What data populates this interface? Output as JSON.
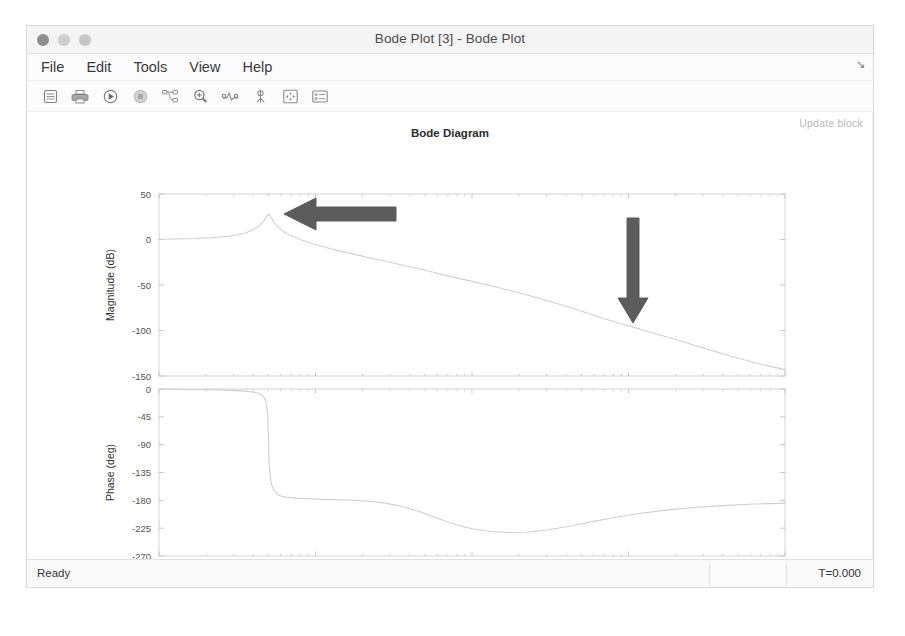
{
  "window": {
    "title": "Bode Plot [3] - Bode Plot",
    "traffic_lights": [
      "close",
      "minimize",
      "zoom"
    ]
  },
  "menubar": {
    "items": [
      {
        "label": "File",
        "name": "menu-file"
      },
      {
        "label": "Edit",
        "name": "menu-edit"
      },
      {
        "label": "Tools",
        "name": "menu-tools"
      },
      {
        "label": "View",
        "name": "menu-view"
      },
      {
        "label": "Help",
        "name": "menu-help"
      }
    ],
    "corner_glyph": "↘"
  },
  "toolbar": {
    "buttons": [
      {
        "icon": "save-icon",
        "title": "Save"
      },
      {
        "icon": "print-icon",
        "title": "Print"
      },
      {
        "icon": "run-icon",
        "title": "Run"
      },
      {
        "icon": "stop-icon",
        "title": "Stop"
      },
      {
        "icon": "linearization-icon",
        "title": "Linearization"
      },
      {
        "icon": "zoom-in-icon",
        "title": "Zoom In"
      },
      {
        "icon": "peak-response-icon",
        "title": "Peak Response"
      },
      {
        "icon": "data-cursor-icon",
        "title": "Data Cursor"
      },
      {
        "icon": "fit-to-view-icon",
        "title": "Fit to View"
      },
      {
        "icon": "properties-icon",
        "title": "Properties"
      }
    ]
  },
  "figure": {
    "update_block_label": "Update block"
  },
  "statusbar": {
    "status": "Ready",
    "time": "T=0.000"
  },
  "annotations": [
    {
      "name": "left-arrow-annotation",
      "direction": "left",
      "color": "#5c5c5c"
    },
    {
      "name": "down-arrow-annotation",
      "direction": "down",
      "color": "#5c5c5c"
    }
  ],
  "chart_data": {
    "type": "line",
    "title": "Bode Diagram",
    "xlabel": "Frequency  (rad/s)",
    "xscale": "log",
    "xlim": [
      1,
      10000
    ],
    "xticks": [
      1,
      10,
      100,
      1000,
      10000
    ],
    "xticklabels": [
      "10^0",
      "10^1",
      "10^2",
      "10^3",
      "10^4"
    ],
    "grid": false,
    "legend": null,
    "line_color": "#cfcfcf",
    "subplots": [
      {
        "name": "magnitude",
        "ylabel": "Magnitude (dB)",
        "ylim": [
          -150,
          50
        ],
        "yticks": [
          50,
          0,
          -50,
          -100,
          -150
        ],
        "yticklabels": [
          "50",
          "0",
          "-50",
          "-100",
          "-150"
        ],
        "x": [
          1,
          1.3,
          1.7,
          2.2,
          2.8,
          3.2,
          3.6,
          4.0,
          4.3,
          4.6,
          4.8,
          5.0,
          5.2,
          5.4,
          5.6,
          5.9,
          6.3,
          7.0,
          8.0,
          9.0,
          10,
          13,
          17,
          22,
          30,
          40,
          55,
          70,
          100,
          140,
          200,
          300,
          450,
          700,
          1000,
          1500,
          2200,
          3200,
          4600,
          6800,
          10000
        ],
        "y": [
          0.3,
          0.6,
          1.1,
          2.0,
          3.6,
          5.2,
          7.4,
          10.6,
          14.0,
          19.0,
          23.5,
          27.8,
          24.0,
          19.5,
          16.0,
          12.0,
          8.5,
          4.0,
          0.0,
          -3.0,
          -5.5,
          -11.0,
          -15.5,
          -20.0,
          -25.0,
          -30.0,
          -35.5,
          -40.0,
          -46.0,
          -52.0,
          -58.5,
          -67.0,
          -76.0,
          -87.0,
          -95.0,
          -103.5,
          -112.0,
          -120.5,
          -128.5,
          -136.5,
          -143.0
        ]
      },
      {
        "name": "phase",
        "ylabel": "Phase (deg)",
        "ylim": [
          -270,
          0
        ],
        "yticks": [
          0,
          -45,
          -90,
          -135,
          -180,
          -225,
          -270
        ],
        "yticklabels": [
          "0",
          "-45",
          "-90",
          "-135",
          "-180",
          "-225",
          "-270"
        ],
        "x": [
          1,
          1.5,
          2.2,
          3.0,
          3.6,
          4.0,
          4.3,
          4.6,
          4.8,
          4.95,
          5.05,
          5.2,
          5.4,
          5.7,
          6.0,
          6.5,
          7.5,
          9.0,
          11,
          14,
          18,
          22,
          28,
          36,
          46,
          60,
          80,
          100,
          130,
          170,
          220,
          300,
          420,
          600,
          850,
          1200,
          1800,
          2600,
          4000,
          6500,
          10000
        ],
        "y": [
          -0.4,
          -0.7,
          -1.2,
          -2.2,
          -3.5,
          -5.0,
          -7.0,
          -11.0,
          -18.0,
          -40.0,
          -120.0,
          -152.0,
          -163.0,
          -170.0,
          -173.0,
          -175.0,
          -176.5,
          -177.5,
          -178.5,
          -179.0,
          -180.0,
          -181.5,
          -184.5,
          -190.0,
          -198.0,
          -209.0,
          -220.0,
          -226.0,
          -230.5,
          -232.0,
          -231.5,
          -228.0,
          -222.0,
          -214.0,
          -207.0,
          -201.0,
          -195.5,
          -191.5,
          -188.5,
          -186.0,
          -184.5
        ]
      }
    ]
  }
}
